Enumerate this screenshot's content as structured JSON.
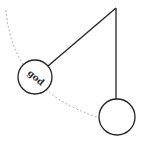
{
  "diagram": {
    "type": "pendulum",
    "bob_label": "god",
    "colors": {
      "stroke": "#222222",
      "arc": "#999999",
      "background": "#ffffff"
    }
  }
}
